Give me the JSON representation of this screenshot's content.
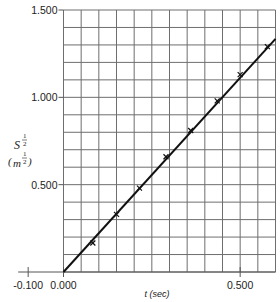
{
  "chart_data": {
    "type": "line",
    "title": "",
    "xlabel": "t (sec)",
    "ylabel": {
      "base": "S",
      "exponent_num": "1",
      "exponent_den": "2",
      "unit_base": "m",
      "unit_exponent_num": "1",
      "unit_exponent_den": "2"
    },
    "xlim": [
      0.0,
      0.6
    ],
    "ylim": [
      0.0,
      1.5
    ],
    "x_ticks": [
      {
        "value": -0.1,
        "label": "-0.100"
      },
      {
        "value": 0.0,
        "label": "0.000"
      },
      {
        "value": 0.5,
        "label": "0.500"
      }
    ],
    "y_ticks": [
      {
        "value": 0.5,
        "label": "0.500"
      },
      {
        "value": 1.0,
        "label": "1.000"
      },
      {
        "value": 1.5,
        "label": "1.500"
      }
    ],
    "grid": true,
    "grid_x_step": 0.05,
    "grid_y_step": 0.1,
    "series": [
      {
        "name": "measured",
        "marker": "x",
        "points": [
          {
            "x": 0.083,
            "y": 0.166
          },
          {
            "x": 0.15,
            "y": 0.33
          },
          {
            "x": 0.215,
            "y": 0.48
          },
          {
            "x": 0.29,
            "y": 0.66
          },
          {
            "x": 0.36,
            "y": 0.81
          },
          {
            "x": 0.435,
            "y": 0.98
          },
          {
            "x": 0.5,
            "y": 1.13
          },
          {
            "x": 0.577,
            "y": 1.29
          }
        ]
      },
      {
        "name": "fit-line",
        "marker": "none",
        "points": [
          {
            "x": 0.0,
            "y": 0.0
          },
          {
            "x": 0.6,
            "y": 1.335
          }
        ]
      }
    ],
    "legend": "none"
  }
}
